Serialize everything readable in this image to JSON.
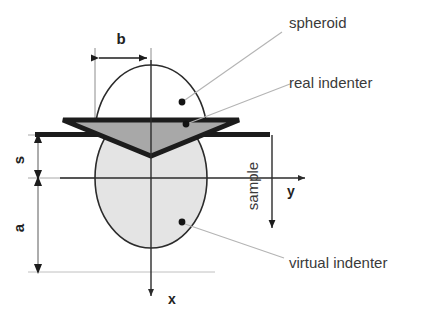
{
  "figure": {
    "labels": {
      "spheroid": "spheroid",
      "real_indenter": "real indenter",
      "virtual_indenter": "virtual indenter",
      "sample": "sample"
    },
    "dimensions": {
      "b": "b",
      "s": "s",
      "a": "a"
    },
    "axes": {
      "x": "x",
      "y": "y"
    },
    "colors": {
      "background": "#ffffff",
      "indenter_fill": "#a8a8a8",
      "indenter_stroke": "#1c1c1c",
      "ellipse_fill": "#e2e2e2",
      "ellipse_stroke": "#2b2b2b",
      "surface_line": "#1c1c1c",
      "leader_line": "#b4b4b4",
      "thin_guide": "#909090",
      "text": "#3a3a3a",
      "marker_dot": "#141414"
    },
    "geometry": {
      "center_x": 151,
      "surface_y": 135,
      "ellipse_center_y": 178,
      "ellipse_rx": 56,
      "ellipse_ry": 70,
      "spheroid_arc_ry": 40,
      "indenter_tip_y": 156,
      "b_arrow_y": 58,
      "a_bottom_y": 272
    },
    "markers": [
      {
        "name": "spheroid-dot",
        "cx": 182,
        "cy": 102
      },
      {
        "name": "real-indenter-dot",
        "cx": 186,
        "cy": 124
      },
      {
        "name": "virtual-indenter-dot",
        "cx": 182,
        "cy": 222
      }
    ]
  }
}
